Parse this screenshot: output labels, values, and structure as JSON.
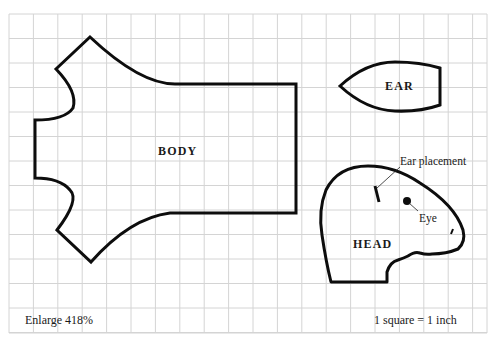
{
  "diagram": {
    "type": "sewing-pattern",
    "grid": {
      "left": 9,
      "top": 14,
      "right": 487,
      "bottom": 333,
      "col_spacing": 24.4,
      "row_spacing": 24.5,
      "line_color": "#d4d4d4"
    },
    "outline_color": "#0d0d0d",
    "pieces": [
      {
        "id": "body",
        "label": "BODY"
      },
      {
        "id": "ear",
        "label": "EAR"
      },
      {
        "id": "head",
        "label": "HEAD"
      }
    ],
    "annotations": {
      "ear_placement": "Ear placement",
      "eye": "Eye"
    },
    "footer": {
      "enlarge": "Enlarge 418%",
      "scale": "1 square = 1 inch"
    }
  }
}
